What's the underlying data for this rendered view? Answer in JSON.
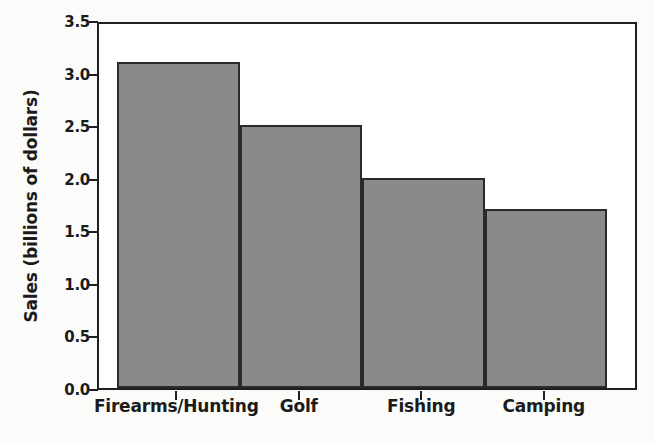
{
  "chart_data": {
    "type": "bar",
    "title": "",
    "xlabel": "",
    "ylabel": "Sales (billions of dollars)",
    "categories": [
      "Firearms/Hunting",
      "Golf",
      "Fishing",
      "Camping"
    ],
    "values": [
      3.1,
      2.5,
      2.0,
      1.7
    ],
    "ylim": [
      0.0,
      3.5
    ],
    "ytick_labels": [
      "0.0",
      "0.5",
      "1.0",
      "1.5",
      "2.0",
      "2.5",
      "3.0",
      "3.5"
    ],
    "ytick_values": [
      0.0,
      0.5,
      1.0,
      1.5,
      2.0,
      2.5,
      3.0,
      3.5
    ],
    "grid": false,
    "legend": null,
    "bar_color": "#8a8a8a",
    "bar_edge_color": "#2a2a2a",
    "axis_color": "#1f1f1f",
    "plot_background": "#ffffff",
    "page_background": "#fbfbf9"
  }
}
